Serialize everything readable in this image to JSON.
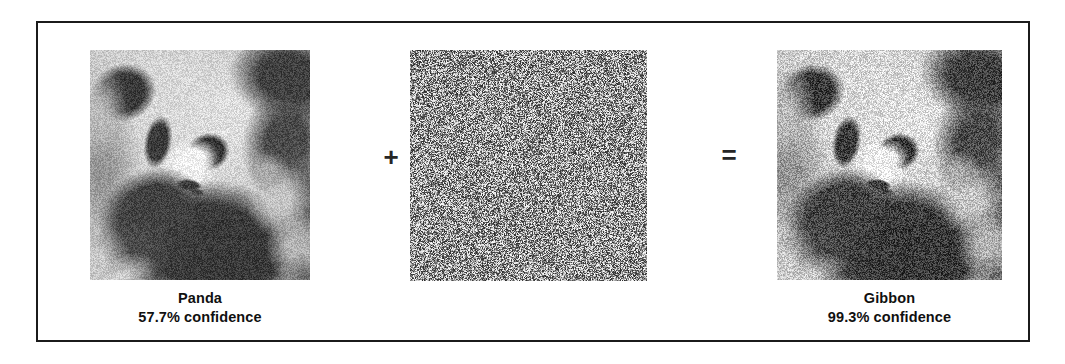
{
  "figure": {
    "panels": [
      {
        "id": "original",
        "role": "original-input-image",
        "image_kind": "panda-photo-grayscale",
        "label": "Panda",
        "confidence": "57.7% confidence"
      },
      {
        "id": "noise",
        "role": "adversarial-perturbation",
        "image_kind": "random-noise-grayscale",
        "label": "",
        "confidence": ""
      },
      {
        "id": "adversarial",
        "role": "adversarial-output-image",
        "image_kind": "panda-photo-grayscale-perturbed",
        "label": "Gibbon",
        "confidence": "99.3% confidence"
      }
    ],
    "operators": {
      "plus": "+",
      "equals": "="
    },
    "colors": {
      "border": "#1b1b1b",
      "background": "#ffffff",
      "text": "#101010"
    }
  }
}
